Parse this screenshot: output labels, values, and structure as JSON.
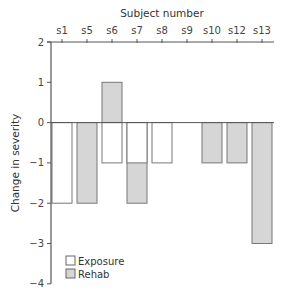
{
  "chart_data": {
    "type": "bar",
    "title": "",
    "xlabel": "Subject number",
    "ylabel": "Change in severity",
    "categories": [
      "s1",
      "s5",
      "s6",
      "s7",
      "s8",
      "s9",
      "s10",
      "s12",
      "s13"
    ],
    "series": [
      {
        "name": "Exposure",
        "color": "#ffffff",
        "values": [
          -2,
          null,
          -1,
          -1,
          -1,
          null,
          null,
          null,
          null
        ]
      },
      {
        "name": "Rehab",
        "color": "#d6d6d6",
        "values": [
          null,
          -2,
          1,
          -2,
          null,
          null,
          -1,
          -1,
          -3
        ]
      }
    ],
    "ylim": [
      -4,
      2
    ],
    "yticks": [
      2,
      1,
      0,
      -1,
      -2,
      -3,
      -4
    ],
    "x_axis_position": "top",
    "grid": false,
    "legend_position": "lower-left",
    "legend": [
      "Exposure",
      "Rehab"
    ]
  },
  "colors": {
    "axis": "#555555",
    "bar_stroke": "#777777",
    "exposure_fill": "#ffffff",
    "rehab_fill": "#d6d6d6"
  }
}
